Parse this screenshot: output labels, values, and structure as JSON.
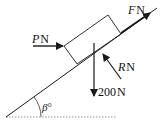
{
  "diagram": {
    "type": "inclined-plane-force-diagram",
    "forces": {
      "applied": {
        "symbol": "P",
        "unit": "N"
      },
      "friction_or_pull": {
        "symbol": "F",
        "unit": "N"
      },
      "normal": {
        "symbol": "R",
        "unit": "N"
      },
      "weight": {
        "value": "200",
        "unit": "N"
      }
    },
    "angle": {
      "symbol": "β",
      "unit": "°"
    },
    "colors": {
      "line": "#1a1a1a",
      "dotted": "#777777",
      "background": "#ffffff"
    }
  }
}
